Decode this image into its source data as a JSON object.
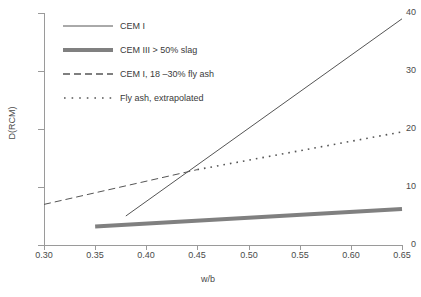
{
  "chart_data": {
    "type": "line",
    "title": "",
    "xlabel": "w/b",
    "ylabel": "D(RCM)",
    "xlim": [
      0.3,
      0.65
    ],
    "ylim": [
      0,
      40
    ],
    "xticks": [
      "0.30",
      "0.35",
      "0.40",
      "0.45",
      "0.50",
      "0.55",
      "0.60",
      "0.65"
    ],
    "xtick_values": [
      0.3,
      0.35,
      0.4,
      0.45,
      0.5,
      0.55,
      0.6,
      0.65
    ],
    "yticks": [
      "0",
      "10",
      "20",
      "30",
      "40"
    ],
    "ytick_values": [
      0,
      10,
      20,
      30,
      40
    ],
    "grid": false,
    "legend_position": "upper-left-inside",
    "series": [
      {
        "name": "CEM I",
        "style": "solid",
        "width": 1,
        "color": "#555555",
        "x": [
          0.38,
          0.65
        ],
        "values": [
          5.0,
          39.0
        ]
      },
      {
        "name": "CEM III > 50% slag",
        "style": "solid",
        "width": 4,
        "color": "#808080",
        "x": [
          0.35,
          0.65
        ],
        "values": [
          3.2,
          6.2
        ]
      },
      {
        "name": "CEM I, 18 –30% fly ash",
        "style": "dashed",
        "width": 1,
        "color": "#555555",
        "x": [
          0.3,
          0.45
        ],
        "values": [
          7.0,
          13.0
        ]
      },
      {
        "name": "Fly ash, extrapolated",
        "style": "dotted",
        "width": 1.6,
        "color": "#555555",
        "x": [
          0.45,
          0.65
        ],
        "values": [
          13.0,
          19.5
        ]
      }
    ],
    "annotations": []
  },
  "legend": {
    "items": [
      {
        "label": "CEM I"
      },
      {
        "label": "CEM III > 50% slag"
      },
      {
        "label": "CEM I, 18 –30% fly ash"
      },
      {
        "label": "Fly ash, extrapolated"
      }
    ]
  },
  "axes": {
    "y_title": "D(RCM)",
    "x_title": "w/b"
  }
}
